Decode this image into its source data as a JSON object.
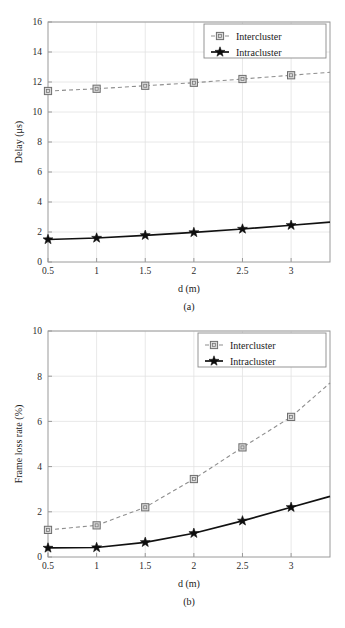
{
  "chart_data": [
    {
      "id": "a",
      "type": "line",
      "title": "",
      "caption": "(a)",
      "xlabel": "d (m)",
      "ylabel": "Delay (μs)",
      "x": [
        0.5,
        1,
        1.5,
        2,
        2.5,
        3
      ],
      "xticklabels": [
        "0.5",
        "1",
        "1.5",
        "2",
        "2.5",
        "3"
      ],
      "yticklabels": [
        "0",
        "2",
        "4",
        "6",
        "8",
        "10",
        "12",
        "14",
        "16"
      ],
      "xlim": [
        0.5,
        3.4
      ],
      "ylim": [
        0,
        16
      ],
      "grid": true,
      "legend_position": "top-right",
      "series": [
        {
          "name": "Intercluster",
          "marker": "square",
          "linestyle": "dashed",
          "color": "#8e8e8e",
          "values": [
            11.4,
            11.55,
            11.75,
            11.95,
            12.2,
            12.45
          ],
          "extrapolated_end": 12.65
        },
        {
          "name": "Intracluster",
          "marker": "star",
          "linestyle": "solid",
          "color": "#111111",
          "values": [
            1.5,
            1.6,
            1.78,
            1.97,
            2.2,
            2.45
          ],
          "extrapolated_end": 2.66
        }
      ]
    },
    {
      "id": "b",
      "type": "line",
      "title": "",
      "caption": "(b)",
      "xlabel": "d (m)",
      "ylabel": "Frame loss rate (%)",
      "x": [
        0.5,
        1,
        1.5,
        2,
        2.5,
        3
      ],
      "xticklabels": [
        "0.5",
        "1",
        "1.5",
        "2",
        "2.5",
        "3"
      ],
      "yticklabels": [
        "0",
        "2",
        "4",
        "6",
        "8",
        "10"
      ],
      "xlim": [
        0.5,
        3.4
      ],
      "ylim": [
        0,
        10
      ],
      "grid": true,
      "legend_position": "top-right",
      "series": [
        {
          "name": "Intercluster",
          "marker": "square",
          "linestyle": "dashed",
          "color": "#8e8e8e",
          "values": [
            1.2,
            1.4,
            2.2,
            3.45,
            4.85,
            6.2
          ],
          "extrapolated_end": 7.7
        },
        {
          "name": "Intracluster",
          "marker": "star",
          "linestyle": "solid",
          "color": "#111111",
          "values": [
            0.4,
            0.42,
            0.65,
            1.05,
            1.6,
            2.2
          ],
          "extrapolated_end": 2.68
        }
      ]
    }
  ]
}
